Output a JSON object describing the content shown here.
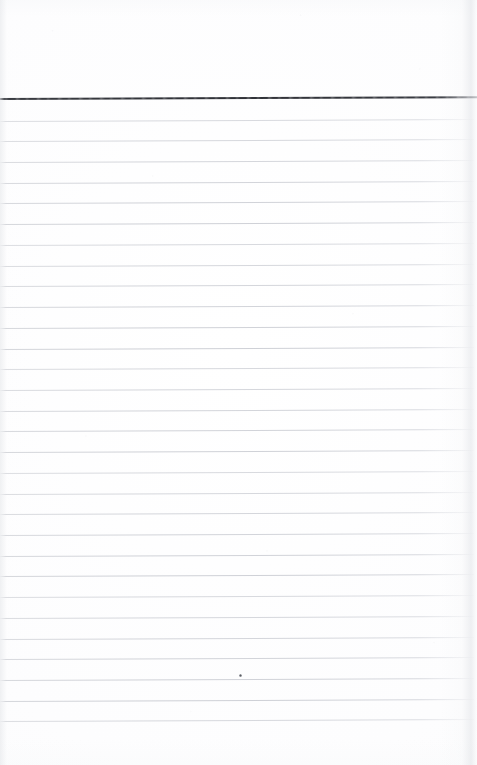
{
  "document": {
    "kind": "scanned-ruled-notepad-page",
    "title": "Blank Ruled Notepad Page",
    "content_text": "",
    "header_text": "",
    "width_px": 477,
    "height_px": 765
  },
  "colors": {
    "paper": "#fdfdfd",
    "page_background": "#ffffff",
    "header_rule": "#32343a",
    "ruled_line": "#cfd1d7",
    "edge_shadow": "#e2e4e8",
    "ink_speck": "#5c5e64"
  },
  "header_margin": {
    "label": "blank header margin",
    "top_px": 0,
    "height_px": 97,
    "text": ""
  },
  "header_rule": {
    "label": "heavy header rule",
    "top_px": 98.4,
    "thickness_px": 1.6,
    "tilt_deg": -0.22,
    "color": "#32343a"
  },
  "ruling": {
    "label": "ruled writing lines",
    "first_line_top_px": 120.6,
    "spacing_px": 20.72,
    "line_count": 30,
    "thickness_px": 1,
    "tilt_deg": -0.24,
    "left_px": 0,
    "width_px": 474,
    "color": "#cfd1d7"
  },
  "footer_margin": {
    "label": "blank bottom margin",
    "top_px": 726,
    "height_px": 39,
    "text": ""
  },
  "marks": [
    {
      "name": "ink-speck",
      "label": "small ink speck",
      "x_px": 239,
      "y_px": 674,
      "size_px": 3
    }
  ]
}
